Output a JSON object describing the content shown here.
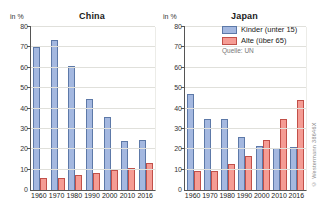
{
  "meta": {
    "source_label": "Quelle: UN",
    "copyright": "© Westermann 38646X"
  },
  "axis": {
    "unit_label": "in %",
    "ticks": [
      80,
      70,
      60,
      50,
      40,
      30,
      20,
      10,
      0
    ],
    "max": 80
  },
  "legend": {
    "items": [
      {
        "label": "Kinder (unter 15)",
        "color": "#a4b8e0",
        "border": "#5d79a8"
      },
      {
        "label": "Alte (über 65)",
        "color": "#f59c94",
        "border": "#c15049"
      }
    ]
  },
  "chart_data": [
    {
      "type": "bar",
      "title": "China",
      "ylabel": "in %",
      "ylim": [
        0,
        80
      ],
      "grid": true,
      "categories": [
        "1960",
        "1970",
        "1980",
        "1990",
        "2000",
        "2010",
        "2016"
      ],
      "series": [
        {
          "name": "Kinder (unter 15)",
          "values": [
            70,
            73.5,
            61,
            44.5,
            36,
            24,
            24.5
          ]
        },
        {
          "name": "Alte (über 65)",
          "values": [
            6,
            6,
            7.5,
            8.5,
            10,
            11,
            13.5
          ]
        }
      ]
    },
    {
      "type": "bar",
      "title": "Japan",
      "ylabel": "in %",
      "ylim": [
        0,
        80
      ],
      "grid": true,
      "legend_position": "top-right",
      "categories": [
        "1960",
        "1970",
        "1980",
        "1990",
        "2000",
        "2010",
        "2016"
      ],
      "series": [
        {
          "name": "Kinder (unter 15)",
          "values": [
            47,
            35,
            35,
            26,
            21.5,
            20.5,
            21
          ]
        },
        {
          "name": "Alte (über 65)",
          "values": [
            9.5,
            9.5,
            13,
            16.5,
            24.5,
            35,
            44
          ]
        }
      ]
    }
  ]
}
